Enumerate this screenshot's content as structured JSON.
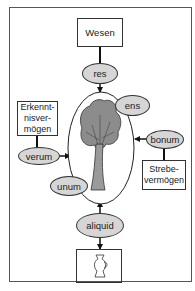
{
  "diagram": {
    "type": "concept-diagram",
    "nodes": {
      "wesen": "Wesen",
      "erkenntnis": "Erkennt-\nnisver-\nmögen",
      "strebe": "Strebe-\nvermögen",
      "vase_box": "vase-icon"
    },
    "ovals": {
      "res": "res",
      "ens": "ens",
      "verum": "verum",
      "bonum": "bonum",
      "unum": "unum",
      "aliquid": "aliquid"
    },
    "center": "tree-icon",
    "edges": [
      {
        "from": "Wesen",
        "to": "res"
      },
      {
        "from": "res",
        "to": "tree"
      },
      {
        "from": "Erkenntnisvermögen",
        "to": "verum"
      },
      {
        "from": "verum",
        "to": "tree"
      },
      {
        "from": "Strebevermögen",
        "to": "bonum"
      },
      {
        "from": "bonum",
        "to": "tree"
      },
      {
        "from": "aliquid",
        "to": "tree"
      },
      {
        "from": "aliquid",
        "to": "vase"
      }
    ],
    "colors": {
      "oval_fill": "#d6d6d6",
      "line": "#222222",
      "tree_fill": "#8c8c8c"
    }
  },
  "caption": "1 2"
}
